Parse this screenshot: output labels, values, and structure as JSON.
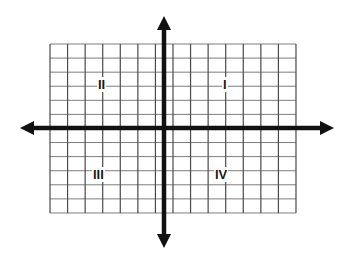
{
  "figure": {
    "kind": "cartesian-coordinate-plane",
    "width": 349,
    "height": 260,
    "background_color": "#ffffff"
  },
  "grid": {
    "line_color": "#6e6e6e",
    "vertical_line_color": "#4a4a4a",
    "horizontal_line_color": "#7d7d7d",
    "left": 50,
    "right": 296,
    "top": 44,
    "bottom": 213,
    "columns": 14,
    "rows": 12,
    "cell_width": 17.57,
    "cell_height": 14.08,
    "vertical_lines": 15,
    "horizontal_lines": 13
  },
  "axes": {
    "color": "#111111",
    "stroke_width": 4.5,
    "origin_x": 164,
    "origin_y": 128,
    "x_axis": {
      "name": "x-axis",
      "left_tip": 20,
      "right_tip": 334,
      "y": 128,
      "arrow_both_ends": true
    },
    "y_axis": {
      "name": "y-axis",
      "top_tip": 16,
      "bottom_tip": 248,
      "x": 164,
      "arrow_both_ends": true
    },
    "arrowhead": {
      "length": 14,
      "half_width": 7
    }
  },
  "quadrants": [
    {
      "id": "quadrant-1",
      "label": "I",
      "x": 222,
      "y": 77,
      "sign_x": "+",
      "sign_y": "+"
    },
    {
      "id": "quadrant-2",
      "label": "II",
      "x": 97,
      "y": 77,
      "sign_x": "-",
      "sign_y": "+"
    },
    {
      "id": "quadrant-3",
      "label": "III",
      "x": 92,
      "y": 167,
      "sign_x": "-",
      "sign_y": "-"
    },
    {
      "id": "quadrant-4",
      "label": "IV",
      "x": 214,
      "y": 167,
      "sign_x": "+",
      "sign_y": "-"
    }
  ]
}
